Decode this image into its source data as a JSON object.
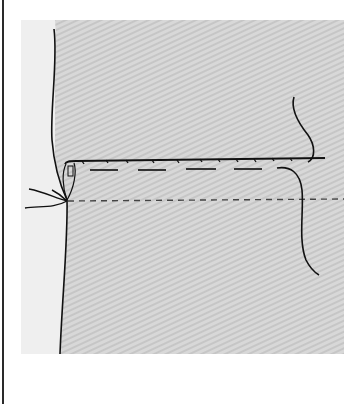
{
  "figure": {
    "colors": {
      "background": "#ffffff",
      "margin_panel": "#efefef",
      "fabric": "#d6d6d6",
      "fabric_stripe": "#c4c4c4",
      "ink": "#111111",
      "dash": "#555555",
      "border": "#2a2a2a"
    },
    "elements": [
      "fabric-panel",
      "fabric-edge",
      "fold-line",
      "hem-stitch-line",
      "basting-long-dashes",
      "fold-guide-short-dashes",
      "thread-tail-right",
      "thread-tails-left",
      "needle-loop"
    ]
  }
}
